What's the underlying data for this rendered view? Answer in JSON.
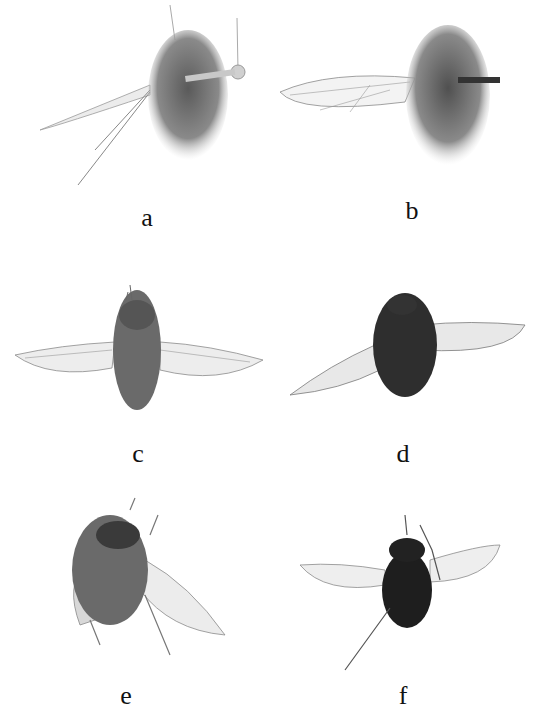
{
  "figure": {
    "panels": [
      {
        "id": "a",
        "label": "a",
        "description": "Bee fly specimen, oblique dorsal view, pinned, one wing spread to left",
        "label_x": 147,
        "label_y": 212
      },
      {
        "id": "b",
        "label": "b",
        "description": "Bee fly specimen, dorsal view, pinned, one wing spread to left",
        "label_x": 412,
        "label_y": 205
      },
      {
        "id": "c",
        "label": "c",
        "description": "Bee fly specimen, dorsal view, both wings spread",
        "label_x": 138,
        "label_y": 448
      },
      {
        "id": "d",
        "label": "d",
        "description": "Dark bee fly specimen, dorsal view, wings spread",
        "label_x": 403,
        "label_y": 448
      },
      {
        "id": "e",
        "label": "e",
        "description": "Bee fly specimen, oblique view, legs extended",
        "label_x": 126,
        "label_y": 683
      },
      {
        "id": "f",
        "label": "f",
        "description": "Dark bee fly specimen, dorsal view, wings spread, legs extended",
        "label_x": 403,
        "label_y": 683
      }
    ],
    "colors": {
      "background": "#ffffff",
      "body_light": "#7a7a7a",
      "body_dark": "#2a2a2a",
      "wing": "#e6e6e6",
      "vein": "#6a6a6a",
      "label": "#111111"
    }
  }
}
